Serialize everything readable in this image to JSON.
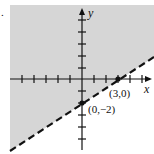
{
  "figure": {
    "marker": ".",
    "type": "linear-inequality-graph",
    "x_axis_label": "x",
    "y_axis_label": "y",
    "boundary": {
      "style": "dashed",
      "equation": "y = (2/3)x - 2",
      "shaded_side": "above-left"
    },
    "points": [
      {
        "label": "(3,0)",
        "x": 3,
        "y": 0
      },
      {
        "label": "(0,−2)",
        "x": 0,
        "y": -2
      }
    ],
    "colors": {
      "shade": "#d6d6d6",
      "ink": "#111111",
      "background": "#ffffff"
    }
  }
}
